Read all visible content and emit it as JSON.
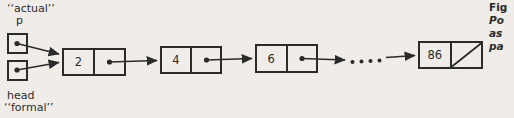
{
  "labels": {
    "actual": "‘‘actual’’",
    "p": "p",
    "head": "head",
    "formal": "‘‘formal’’"
  },
  "nodes": [
    {
      "value": "2",
      "null_pointer": false
    },
    {
      "value": "4",
      "null_pointer": false
    },
    {
      "value": "6",
      "null_pointer": false
    },
    {
      "value": "86",
      "null_pointer": true
    }
  ],
  "caption": {
    "line1": "Fig",
    "line2": "Po",
    "line3": "as",
    "line4": "pa"
  },
  "colors": {
    "ink": "#2b2b2b",
    "paper": "#f0ede8"
  }
}
